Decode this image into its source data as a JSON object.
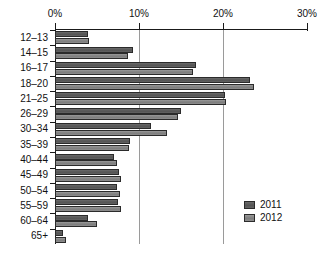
{
  "chart_data": {
    "type": "bar",
    "orientation": "horizontal",
    "title": "",
    "subtitle": "",
    "xlabel": "",
    "ylabel": "",
    "xlim": [
      0,
      30
    ],
    "xtick_labels": [
      "0%",
      "10%",
      "20%",
      "30%"
    ],
    "xtick_values": [
      0,
      10,
      20,
      30
    ],
    "grid": true,
    "grid_axis": "x",
    "legend_position": "bottom-right",
    "categories": [
      "12–13",
      "14–15",
      "16–17",
      "18–20",
      "21–25",
      "26–29",
      "30–34",
      "35–39",
      "40–44",
      "45–49",
      "50–54",
      "55–59",
      "60–64",
      "65+"
    ],
    "series": [
      {
        "name": "2011",
        "color": "#5d5d5d",
        "values": [
          3.9,
          9.3,
          16.8,
          23.2,
          20.2,
          15.0,
          11.4,
          8.9,
          7.0,
          7.6,
          7.4,
          7.5,
          3.9,
          0.9
        ]
      },
      {
        "name": "2012",
        "color": "#8a8a8a",
        "values": [
          4.1,
          8.7,
          16.4,
          23.7,
          20.3,
          14.6,
          13.3,
          8.8,
          7.4,
          7.9,
          7.7,
          7.9,
          5.0,
          1.3
        ]
      }
    ]
  },
  "legend": {
    "entries": [
      {
        "label": "2011"
      },
      {
        "label": "2012"
      }
    ]
  }
}
